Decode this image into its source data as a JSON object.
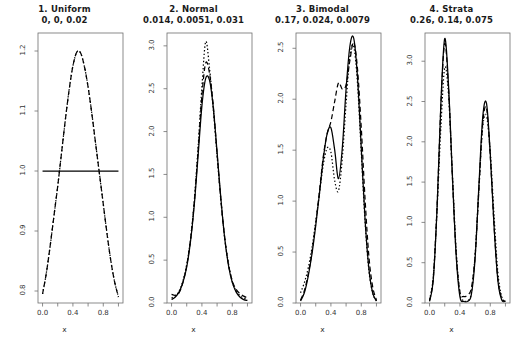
{
  "figure": {
    "background": "#ffffff",
    "line_color": "#000000",
    "panel_count": 4,
    "xlabel": "x",
    "xticks": [
      "0.0",
      "0.4",
      "0.8"
    ],
    "xtick_values": [
      0.0,
      0.4,
      0.8
    ],
    "xlim": [
      -0.06,
      1.06
    ]
  },
  "chart_data": [
    {
      "type": "line",
      "panel": 1,
      "title": "1.  Uniform",
      "subtitle": "0, 0, 0.02",
      "xlabel": "x",
      "ylabel": "",
      "xlim": [
        -0.06,
        1.06
      ],
      "ylim": [
        0.78,
        1.23
      ],
      "xticks": [
        0.0,
        0.4,
        0.8
      ],
      "xticklabels": [
        "0.0",
        "0.4",
        "0.8"
      ],
      "yticks": [
        0.8,
        0.9,
        1.0,
        1.1,
        1.2
      ],
      "yticklabels": [
        "0.8",
        "0.9",
        "1.0",
        "1.1",
        "1.2"
      ],
      "grid": false,
      "legend": "none",
      "series": [
        {
          "name": "true-density",
          "style": "solid",
          "x": [
            0.0,
            0.1,
            0.2,
            0.3,
            0.4,
            0.5,
            0.6,
            0.7,
            0.8,
            0.9,
            1.0
          ],
          "values": [
            1.0,
            1.0,
            1.0,
            1.0,
            1.0,
            1.0,
            1.0,
            1.0,
            1.0,
            1.0,
            1.0
          ]
        },
        {
          "name": "estimate-dashed",
          "style": "dashed",
          "x": [
            0.0,
            0.05,
            0.1,
            0.15,
            0.2,
            0.25,
            0.3,
            0.35,
            0.4,
            0.45,
            0.5,
            0.55,
            0.6,
            0.65,
            0.7,
            0.75,
            0.8,
            0.85,
            0.9,
            0.95,
            1.0
          ],
          "values": [
            0.795,
            0.83,
            0.875,
            0.925,
            0.975,
            1.03,
            1.085,
            1.135,
            1.175,
            1.198,
            1.197,
            1.175,
            1.14,
            1.095,
            1.045,
            0.995,
            0.945,
            0.895,
            0.85,
            0.815,
            0.79
          ]
        },
        {
          "name": "estimate-dotted",
          "style": "dotted",
          "x": [
            0.0,
            0.05,
            0.1,
            0.15,
            0.2,
            0.25,
            0.3,
            0.35,
            0.4,
            0.45,
            0.5,
            0.55,
            0.6,
            0.65,
            0.7,
            0.75,
            0.8,
            0.85,
            0.9,
            0.95,
            1.0
          ],
          "values": [
            0.795,
            0.83,
            0.875,
            0.925,
            0.975,
            1.03,
            1.085,
            1.135,
            1.175,
            1.198,
            1.197,
            1.175,
            1.14,
            1.095,
            1.045,
            0.995,
            0.945,
            0.895,
            0.85,
            0.815,
            0.79
          ]
        }
      ]
    },
    {
      "type": "line",
      "panel": 2,
      "title": "2.  Normal",
      "subtitle": "0.014, 0.0051, 0.031",
      "xlabel": "x",
      "ylabel": "",
      "xlim": [
        -0.06,
        1.06
      ],
      "ylim": [
        0.0,
        3.15
      ],
      "xticks": [
        0.0,
        0.4,
        0.8
      ],
      "xticklabels": [
        "0.0",
        "0.4",
        "0.8"
      ],
      "yticks": [
        0.0,
        0.5,
        1.0,
        1.5,
        2.0,
        2.5,
        3.0
      ],
      "yticklabels": [
        "0.0",
        "0.5",
        "1.0",
        "1.5",
        "2.0",
        "2.5",
        "3.0"
      ],
      "grid": false,
      "legend": "none",
      "series": [
        {
          "name": "true-density",
          "style": "solid",
          "x": [
            0.0,
            0.05,
            0.1,
            0.15,
            0.2,
            0.25,
            0.3,
            0.35,
            0.4,
            0.45,
            0.5,
            0.55,
            0.6,
            0.65,
            0.7,
            0.75,
            0.8,
            0.85,
            0.9,
            0.95,
            1.0
          ],
          "values": [
            0.04,
            0.07,
            0.13,
            0.24,
            0.42,
            0.72,
            1.15,
            1.72,
            2.3,
            2.62,
            2.6,
            2.28,
            1.76,
            1.22,
            0.76,
            0.44,
            0.24,
            0.13,
            0.07,
            0.04,
            0.03
          ]
        },
        {
          "name": "estimate-dashed",
          "style": "dashed",
          "x": [
            0.0,
            0.05,
            0.1,
            0.15,
            0.2,
            0.25,
            0.3,
            0.35,
            0.4,
            0.45,
            0.5,
            0.55,
            0.6,
            0.65,
            0.7,
            0.75,
            0.8,
            0.85,
            0.9,
            0.95,
            1.0
          ],
          "values": [
            0.1,
            0.09,
            0.12,
            0.24,
            0.44,
            0.74,
            1.18,
            1.78,
            2.42,
            2.8,
            2.68,
            2.3,
            1.74,
            1.2,
            0.76,
            0.45,
            0.26,
            0.16,
            0.11,
            0.08,
            0.06
          ]
        },
        {
          "name": "estimate-dotted",
          "style": "dotted",
          "x": [
            0.0,
            0.05,
            0.1,
            0.15,
            0.2,
            0.25,
            0.3,
            0.35,
            0.4,
            0.45,
            0.5,
            0.55,
            0.6,
            0.65,
            0.7,
            0.75,
            0.8,
            0.85,
            0.9,
            0.95,
            1.0
          ],
          "values": [
            0.06,
            0.08,
            0.14,
            0.26,
            0.45,
            0.75,
            1.2,
            1.82,
            2.52,
            3.05,
            2.74,
            2.26,
            1.72,
            1.2,
            0.77,
            0.46,
            0.25,
            0.14,
            0.09,
            0.06,
            0.05
          ]
        }
      ]
    },
    {
      "type": "line",
      "panel": 3,
      "title": "3.  Bimodal",
      "subtitle": "0.17, 0.024, 0.0079",
      "xlabel": "x",
      "ylabel": "",
      "xlim": [
        -0.06,
        1.06
      ],
      "ylim": [
        0.0,
        2.65
      ],
      "xticks": [
        0.0,
        0.4,
        0.8
      ],
      "xticklabels": [
        "0.0",
        "0.4",
        "0.8"
      ],
      "yticks": [
        0.0,
        0.5,
        1.0,
        1.5,
        2.0,
        2.5
      ],
      "yticklabels": [
        "0.0",
        "0.5",
        "1.0",
        "1.5",
        "2.0",
        "2.5"
      ],
      "grid": false,
      "legend": "none",
      "series": [
        {
          "name": "true-density",
          "style": "solid",
          "x": [
            0.0,
            0.05,
            0.1,
            0.15,
            0.2,
            0.25,
            0.3,
            0.35,
            0.4,
            0.45,
            0.5,
            0.55,
            0.6,
            0.65,
            0.7,
            0.75,
            0.8,
            0.85,
            0.9,
            0.95,
            1.0
          ],
          "values": [
            0.02,
            0.1,
            0.26,
            0.48,
            0.76,
            1.08,
            1.42,
            1.66,
            1.72,
            1.5,
            1.22,
            1.52,
            2.1,
            2.52,
            2.6,
            2.22,
            1.52,
            0.82,
            0.34,
            0.1,
            0.02
          ]
        },
        {
          "name": "estimate-dashed",
          "style": "dashed",
          "x": [
            0.0,
            0.05,
            0.1,
            0.15,
            0.2,
            0.25,
            0.3,
            0.35,
            0.4,
            0.45,
            0.5,
            0.55,
            0.6,
            0.65,
            0.7,
            0.75,
            0.8,
            0.85,
            0.9,
            0.95,
            1.0
          ],
          "values": [
            0.03,
            0.12,
            0.28,
            0.5,
            0.78,
            1.1,
            1.44,
            1.66,
            1.78,
            1.98,
            2.16,
            2.1,
            2.14,
            2.38,
            2.56,
            2.3,
            1.72,
            1.02,
            0.46,
            0.16,
            0.03
          ]
        },
        {
          "name": "estimate-dotted",
          "style": "dotted",
          "x": [
            0.0,
            0.05,
            0.1,
            0.15,
            0.2,
            0.25,
            0.3,
            0.35,
            0.4,
            0.45,
            0.5,
            0.55,
            0.6,
            0.65,
            0.7,
            0.75,
            0.8,
            0.85,
            0.9,
            0.95,
            1.0
          ],
          "values": [
            0.1,
            0.2,
            0.34,
            0.54,
            0.8,
            1.08,
            1.36,
            1.52,
            1.48,
            1.2,
            1.1,
            1.42,
            1.96,
            2.42,
            2.52,
            2.16,
            1.48,
            0.8,
            0.32,
            0.1,
            0.02
          ]
        }
      ]
    },
    {
      "type": "line",
      "panel": 4,
      "title": "4.  Strata",
      "subtitle": "0.26, 0.14, 0.075",
      "xlabel": "x",
      "ylabel": "",
      "xlim": [
        -0.06,
        1.06
      ],
      "ylim": [
        0.0,
        3.35
      ],
      "xticks": [
        0.0,
        0.4,
        0.8
      ],
      "xticklabels": [
        "0.0",
        "0.4",
        "0.8"
      ],
      "yticks": [
        0.0,
        0.5,
        1.0,
        1.5,
        2.0,
        2.5,
        3.0
      ],
      "yticklabels": [
        "0.0",
        "0.5",
        "1.0",
        "1.5",
        "2.0",
        "2.5",
        "3.0"
      ],
      "grid": false,
      "legend": "none",
      "series": [
        {
          "name": "true-density",
          "style": "solid",
          "x": [
            0.0,
            0.05,
            0.1,
            0.15,
            0.2,
            0.25,
            0.3,
            0.35,
            0.4,
            0.45,
            0.5,
            0.55,
            0.6,
            0.65,
            0.7,
            0.75,
            0.8,
            0.85,
            0.9,
            0.95,
            1.0
          ],
          "values": [
            0.02,
            0.3,
            1.2,
            2.5,
            3.28,
            2.7,
            1.6,
            0.6,
            0.08,
            0.02,
            0.02,
            0.1,
            0.55,
            1.45,
            2.3,
            2.48,
            1.85,
            0.95,
            0.28,
            0.04,
            0.02
          ]
        },
        {
          "name": "estimate-dashed",
          "style": "dashed",
          "x": [
            0.0,
            0.05,
            0.1,
            0.15,
            0.2,
            0.25,
            0.3,
            0.35,
            0.4,
            0.45,
            0.5,
            0.55,
            0.6,
            0.65,
            0.7,
            0.75,
            0.8,
            0.85,
            0.9,
            0.95,
            1.0
          ],
          "values": [
            0.03,
            0.32,
            1.22,
            2.46,
            3.22,
            2.66,
            1.58,
            0.62,
            0.14,
            0.08,
            0.1,
            0.18,
            0.58,
            1.4,
            2.22,
            2.42,
            1.82,
            0.96,
            0.3,
            0.06,
            0.02
          ]
        },
        {
          "name": "estimate-dotted",
          "style": "dotted",
          "x": [
            0.0,
            0.05,
            0.1,
            0.15,
            0.2,
            0.25,
            0.3,
            0.35,
            0.4,
            0.45,
            0.5,
            0.55,
            0.6,
            0.65,
            0.7,
            0.75,
            0.8,
            0.85,
            0.9,
            0.95,
            1.0
          ],
          "values": [
            0.04,
            0.34,
            1.18,
            2.2,
            2.92,
            2.58,
            1.62,
            0.66,
            0.12,
            0.03,
            0.03,
            0.12,
            0.6,
            1.42,
            2.18,
            2.32,
            1.88,
            1.08,
            0.38,
            0.08,
            0.02
          ]
        }
      ]
    }
  ]
}
